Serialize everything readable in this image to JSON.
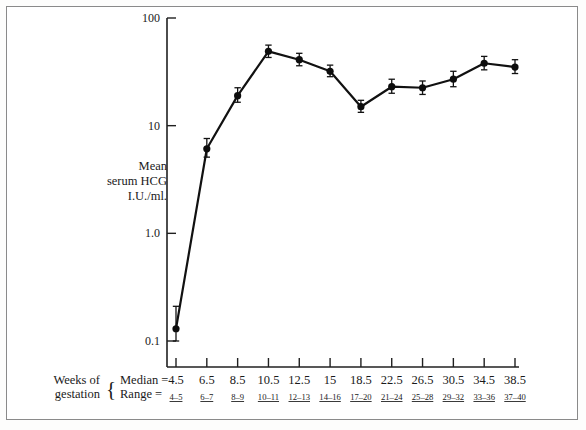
{
  "figure": {
    "y_axis_title_lines": [
      "Mean",
      "serum HCG",
      "I.U./ml."
    ],
    "x_axis_caption_lines": [
      "Weeks of",
      "gestation"
    ],
    "brace_glyph": "{",
    "row_label_median": "Median  =",
    "row_label_range": "Range   ="
  },
  "chart_data": {
    "type": "line",
    "title": "",
    "xlabel": "Weeks of gestation",
    "ylabel": "Mean serum HCG I.U./ml.",
    "yscale": "log",
    "ylim": [
      0.1,
      100
    ],
    "ytick_labels": [
      "100",
      "10",
      "1.0",
      "0.1"
    ],
    "ytick_values": [
      100,
      10,
      1.0,
      0.1
    ],
    "grid": false,
    "legend": "none",
    "categories": [
      "4.5",
      "6.5",
      "8.5",
      "10.5",
      "12.5",
      "15",
      "18.5",
      "22.5",
      "26.5",
      "30.5",
      "34.5",
      "38.5"
    ],
    "x_ranges": [
      "4–5",
      "6–7",
      "8–9",
      "10–11",
      "12–13",
      "14–16",
      "17–20",
      "21–24",
      "25–28",
      "29–32",
      "33–36",
      "37–40"
    ],
    "x_positions": [
      4.5,
      6.5,
      8.5,
      10.5,
      12.5,
      15,
      18.5,
      22.5,
      26.5,
      30.5,
      34.5,
      38.5
    ],
    "values": [
      0.13,
      6.1,
      19.0,
      49.0,
      41.0,
      32.0,
      15.0,
      23.0,
      22.5,
      27.0,
      38.0,
      35.0
    ],
    "err_low": [
      0.1,
      5.1,
      16.5,
      43.0,
      36.0,
      28.5,
      13.3,
      20.0,
      19.5,
      23.0,
      33.0,
      30.5
    ],
    "err_high": [
      0.21,
      7.6,
      22.5,
      56.0,
      47.0,
      36.5,
      17.2,
      27.0,
      26.0,
      32.0,
      44.0,
      41.0
    ],
    "marker": "filled-circle",
    "errorbar": "capped-vertical"
  }
}
